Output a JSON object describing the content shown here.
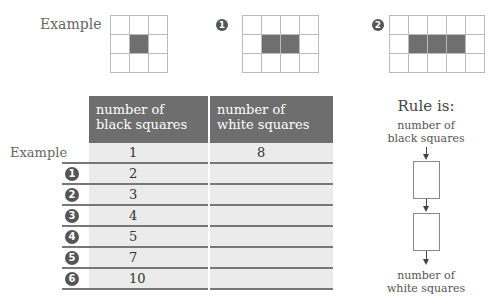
{
  "examples": [
    {
      "label": "Example",
      "badge": null,
      "cols": 3,
      "rows": 3,
      "black_cells": [
        [
          1,
          1
        ]
      ]
    },
    {
      "label": null,
      "badge": "1",
      "cols": 4,
      "rows": 3,
      "black_cells": [
        [
          1,
          1
        ],
        [
          1,
          2
        ]
      ]
    },
    {
      "label": null,
      "badge": "2",
      "cols": 5,
      "rows": 3,
      "black_cells": [
        [
          1,
          1
        ],
        [
          1,
          2
        ],
        [
          1,
          3
        ]
      ]
    }
  ],
  "table": {
    "headers": [
      "number of\nblack squares",
      "number of\nwhite squares"
    ],
    "header_lines": [
      [
        "number of",
        "black squares"
      ],
      [
        "number of",
        "white squares"
      ]
    ],
    "rows": [
      {
        "label": "Example",
        "badge": null,
        "black": "1",
        "white": "8"
      },
      {
        "label": null,
        "badge": "1",
        "black": "2",
        "white": ""
      },
      {
        "label": null,
        "badge": "2",
        "black": "3",
        "white": ""
      },
      {
        "label": null,
        "badge": "3",
        "black": "4",
        "white": ""
      },
      {
        "label": null,
        "badge": "4",
        "black": "5",
        "white": ""
      },
      {
        "label": null,
        "badge": "5",
        "black": "7",
        "white": ""
      },
      {
        "label": null,
        "badge": "6",
        "black": "10",
        "white": ""
      }
    ]
  },
  "rule": {
    "title": "Rule is:",
    "input_label_1": "number of",
    "input_label_2": "black squares",
    "output_label_1": "number of",
    "output_label_2": "white squares",
    "boxes": [
      "",
      ""
    ]
  },
  "colors": {
    "header_bg": "#6e6e6e",
    "cell_bg": "#ebebeb",
    "black_square": "#6f6f6f",
    "grid_line": "#bbbbbb",
    "row_line": "#777777"
  }
}
